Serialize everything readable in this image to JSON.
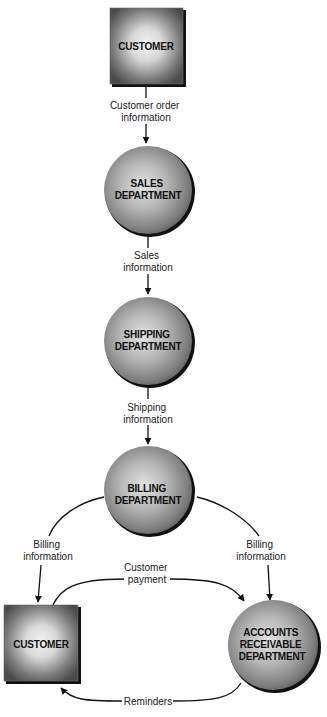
{
  "diagram": {
    "type": "data-flow",
    "nodes": [
      {
        "id": "customer_top",
        "shape": "square",
        "lines": [
          "CUSTOMER"
        ]
      },
      {
        "id": "sales",
        "shape": "circle",
        "lines": [
          "SALES",
          "DEPARTMENT"
        ]
      },
      {
        "id": "shipping",
        "shape": "circle",
        "lines": [
          "SHIPPING",
          "DEPARTMENT"
        ]
      },
      {
        "id": "billing",
        "shape": "circle",
        "lines": [
          "BILLING",
          "DEPARTMENT"
        ]
      },
      {
        "id": "customer_bottom",
        "shape": "square",
        "lines": [
          "CUSTOMER"
        ]
      },
      {
        "id": "accounts",
        "shape": "circle",
        "lines": [
          "ACCOUNTS",
          "RECEIVABLE",
          "DEPARTMENT"
        ]
      }
    ],
    "flows": [
      {
        "from": "customer_top",
        "to": "sales",
        "lines": [
          "Customer order",
          "information"
        ]
      },
      {
        "from": "sales",
        "to": "shipping",
        "lines": [
          "Sales",
          "information"
        ]
      },
      {
        "from": "shipping",
        "to": "billing",
        "lines": [
          "Shipping",
          "information"
        ]
      },
      {
        "from": "billing",
        "to": "customer_bottom",
        "lines": [
          "Billing",
          "information"
        ]
      },
      {
        "from": "billing",
        "to": "accounts",
        "lines": [
          "Billing",
          "information"
        ]
      },
      {
        "from": "customer_bottom",
        "to": "accounts",
        "lines": [
          "Customer",
          "payment"
        ]
      },
      {
        "from": "accounts",
        "to": "customer_bottom",
        "lines": [
          "Reminders"
        ]
      }
    ]
  },
  "colors": {
    "node_center": "#e6e6e6",
    "node_edge": "#555555",
    "square_center": "#f2f2f2",
    "square_edge": "#4a4a4a",
    "shadow": "#111111",
    "line": "#111111",
    "text": "#111111"
  }
}
